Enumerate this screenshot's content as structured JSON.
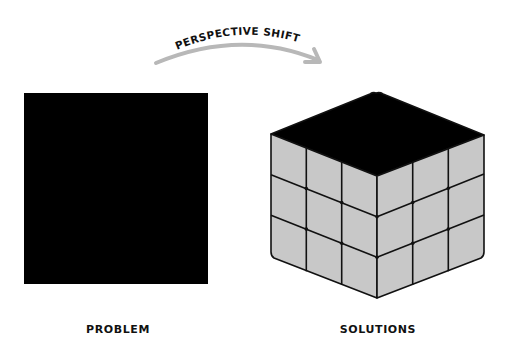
{
  "diagram": {
    "arrow_label": "PERSPECTIVE SHIFT",
    "left": {
      "caption": "PROBLEM",
      "shape": "black-square"
    },
    "right": {
      "caption": "SOLUTIONS",
      "shape": "3x3x3-cube"
    }
  },
  "colors": {
    "background": "#ffffff",
    "square_fill": "#000000",
    "cube_top": "#000000",
    "cube_face": "#c8c8c8",
    "cube_lines": "#111111",
    "arrow": "#b8b8b8",
    "text": "#111111"
  }
}
